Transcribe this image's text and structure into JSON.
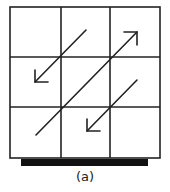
{
  "figure": {
    "caption": "(a)",
    "grid": {
      "rows": 3,
      "cols": 3,
      "left": 10,
      "top": 7,
      "right": 160,
      "bottom": 158,
      "col_lines": [
        61,
        110
      ],
      "row_lines": [
        57,
        107
      ]
    },
    "base_bar": {
      "x1": 21,
      "x2": 148,
      "y": 159,
      "height": 7,
      "color": "#111111"
    },
    "arrows": [
      {
        "id": "arrow-top-left",
        "from": [
          86,
          30
        ],
        "to": [
          35,
          82
        ],
        "direction": "down-left"
      },
      {
        "id": "arrow-main-diagonal",
        "from": [
          36,
          135
        ],
        "to": [
          137,
          32
        ],
        "direction": "up-right"
      },
      {
        "id": "arrow-bottom-right",
        "from": [
          137,
          80
        ],
        "to": [
          87,
          131
        ],
        "direction": "down-left"
      }
    ],
    "line_color": "#222222"
  }
}
